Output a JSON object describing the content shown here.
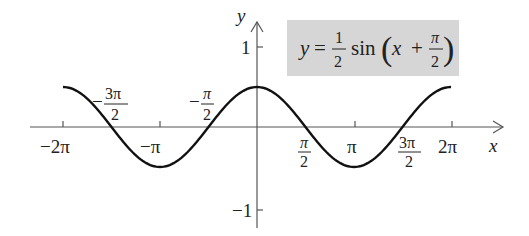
{
  "chart_data": {
    "type": "line",
    "equation": {
      "lhs": "y",
      "coef_num": "1",
      "coef_den": "2",
      "func": "sin",
      "arg_var": "x",
      "arg_op": "+",
      "arg_num": "π",
      "arg_den": "2"
    },
    "xlabel": "x",
    "ylabel": "y",
    "xlim": [
      -6.2832,
      6.2832
    ],
    "ylim": [
      -1,
      1
    ],
    "grid": false,
    "x_ticks": [
      "−2π",
      "−3π/2",
      "−π",
      "−π/2",
      "π/2",
      "π",
      "3π/2",
      "2π"
    ],
    "y_ticks": [
      "1",
      "−1"
    ],
    "series": [
      {
        "name": "y = 1/2 sin(x + π/2)",
        "x": [
          -6.2832,
          -4.7124,
          -3.1416,
          -1.5708,
          0,
          1.5708,
          3.1416,
          4.7124,
          6.2832
        ],
        "values": [
          0.5,
          0,
          -0.5,
          0,
          0.5,
          0,
          -0.5,
          0,
          0.5
        ]
      }
    ]
  },
  "labels": {
    "x_axis": "x",
    "y_axis": "y",
    "neg2pi": "−2π",
    "negpi": "−π",
    "pi": "π",
    "twopi": "2π",
    "neg": "−",
    "pi_sym": "π",
    "three_pi": "3π",
    "two": "2",
    "y1": "1",
    "yneg1": "−1",
    "eq_y": "y",
    "eq_eq": "=",
    "eq_one": "1",
    "eq_two": "2",
    "eq_sin": "sin",
    "eq_x": "x",
    "eq_plus": "+",
    "eq_pi": "π"
  }
}
